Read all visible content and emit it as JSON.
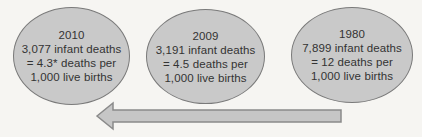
{
  "bubbles": [
    {
      "year": "2010",
      "infant_deaths": "3,077",
      "rate_per_1000": "4.3*",
      "lines": [
        "2010",
        "3,077 infant deaths",
        "= 4.3* deaths per",
        "1,000 live births"
      ]
    },
    {
      "year": "2009",
      "infant_deaths": "3,191",
      "rate_per_1000": "4.5",
      "lines": [
        "2009",
        "3,191 infant deaths",
        "= 4.5 deaths per",
        "1,000 live births"
      ]
    },
    {
      "year": "1980",
      "infant_deaths": "7,899",
      "rate_per_1000": "12",
      "lines": [
        "1980",
        "7,899 infant deaths",
        "= 12 deaths per",
        "1,000 live births"
      ]
    }
  ],
  "arrow": {
    "direction": "left"
  },
  "colors": {
    "background": "#f6f5f2",
    "bubble_fill": "#c9c9c9",
    "bubble_border": "#7a7a7a",
    "text": "#333333",
    "arrow_fill": "#c6c6c6",
    "arrow_border": "#8a8a8a"
  }
}
